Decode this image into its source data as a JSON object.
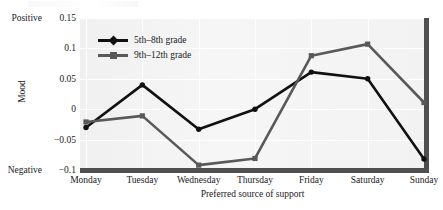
{
  "chart_data": {
    "type": "line",
    "title": "",
    "xlabel": "Preferred source of support",
    "ylabel": "Mood",
    "categories": [
      "Monday",
      "Tuesday",
      "Wednesday",
      "Thursday",
      "Friday",
      "Saturday",
      "Sunday"
    ],
    "series": [
      {
        "name": "5th–8th grade",
        "color": "#111111",
        "marker": "diamond",
        "values": [
          -0.03,
          0.04,
          -0.033,
          0.0,
          0.061,
          0.05,
          -0.082
        ]
      },
      {
        "name": "9th–12th grade",
        "color": "#595959",
        "marker": "square",
        "values": [
          -0.021,
          -0.011,
          -0.092,
          -0.081,
          0.088,
          0.107,
          0.011
        ]
      }
    ],
    "ylim": [
      -0.1,
      0.15
    ],
    "yticks": [
      0.15,
      0.1,
      0.05,
      0,
      -0.05,
      -0.1
    ],
    "ytick_labels": [
      "0.15",
      "0.1",
      "0.05",
      "0",
      "−0.05",
      "−0.1"
    ],
    "y_axis_endpoint_labels": {
      "top": "Positive",
      "bottom": "Negative"
    },
    "grid": true,
    "legend_position": "upper-left-inside"
  },
  "axis": {
    "ylabel": "Mood",
    "xlabel": "Preferred source of support",
    "positive_label": "Positive",
    "negative_label": "Negative"
  },
  "legend": {
    "items": [
      {
        "label": "5th–8th grade",
        "color": "#111111"
      },
      {
        "label": "9th–12th grade",
        "color": "#595959"
      }
    ]
  }
}
